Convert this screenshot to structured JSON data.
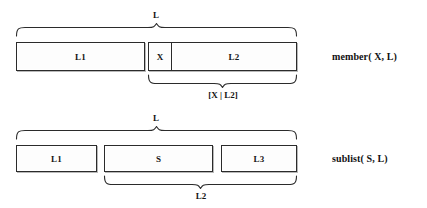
{
  "figure": {
    "background_color": "#ffffff",
    "line_color": "#2b2b2b",
    "box_fill": "#fdfdfd",
    "shadow_color": "#b9b9b9"
  },
  "diagrams": [
    {
      "id": "member-diagram",
      "predicate_label": "member( X, L)",
      "top_brace_label": "L",
      "bottom_brace_label": "[X | L2]",
      "boxes": [
        {
          "label": "L1"
        },
        {
          "label": "X"
        },
        {
          "label": "L2"
        }
      ]
    },
    {
      "id": "sublist-diagram",
      "predicate_label": "sublist( S, L)",
      "top_brace_label": "L",
      "bottom_brace_label": "L2",
      "boxes": [
        {
          "label": "L1"
        },
        {
          "label": "S"
        },
        {
          "label": "L3"
        }
      ]
    }
  ]
}
